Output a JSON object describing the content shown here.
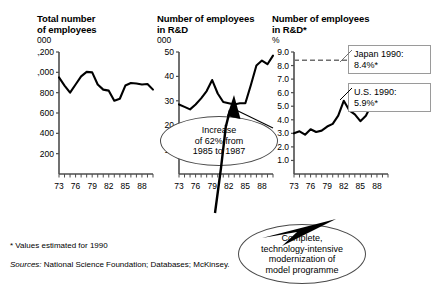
{
  "figure": {
    "footnote": "* Values estimated for 1990",
    "sources_label": "Sources:",
    "sources_text": "National Science Foundation; Databases; McKinsey."
  },
  "callouts": {
    "japan": "Japan 1990:\n8.4%*",
    "us": "U.S. 1990:\n5.9%*"
  },
  "notes": {
    "increase": "Increase\nof 62% from\n1985 to 1987",
    "modernization": "Complete,\ntechnology-intensive\nmodernization of\nmodel programme"
  },
  "panels": {
    "p1": {
      "title": "Total number\nof employees",
      "unit": "000"
    },
    "p2": {
      "title": "Number of employees\nin R&D",
      "unit": "000"
    },
    "p3": {
      "title": "Number of employees\nin R&D*",
      "unit": "%"
    }
  },
  "chart_data": [
    {
      "id": "total-employees",
      "type": "line",
      "title": "Total number of employees",
      "xlabel": "",
      "ylabel": "000",
      "ylim": [
        0,
        1200
      ],
      "yticks": [
        200,
        400,
        600,
        800,
        1000,
        1200
      ],
      "ytick_labels": [
        "200",
        "400",
        "600",
        "800",
        "1,000",
        "1,200"
      ],
      "xlim": [
        73,
        90
      ],
      "xticks": [
        73,
        76,
        79,
        82,
        85,
        88
      ],
      "xtick_labels": [
        "73",
        "76",
        "79",
        "82",
        "85",
        "88"
      ],
      "grid": false,
      "x": [
        73,
        74,
        75,
        76,
        77,
        78,
        79,
        80,
        81,
        82,
        83,
        84,
        85,
        86,
        87,
        88,
        89,
        90
      ],
      "values": [
        950,
        870,
        800,
        880,
        960,
        1005,
        1000,
        880,
        830,
        820,
        720,
        740,
        870,
        895,
        890,
        880,
        885,
        830
      ]
    },
    {
      "id": "rd-employees",
      "type": "line",
      "title": "Number of employees in R&D",
      "xlabel": "",
      "ylabel": "000",
      "ylim": [
        0,
        50
      ],
      "yticks": [
        10,
        20,
        30,
        40,
        50
      ],
      "ytick_labels": [
        "10",
        "20",
        "30",
        "40",
        "50"
      ],
      "xlim": [
        73,
        90
      ],
      "xticks": [
        73,
        76,
        79,
        82,
        85,
        88
      ],
      "xtick_labels": [
        "73",
        "76",
        "79",
        "82",
        "85",
        "88"
      ],
      "grid": false,
      "x": [
        73,
        74,
        75,
        76,
        77,
        78,
        79,
        80,
        81,
        82,
        83,
        84,
        85,
        86,
        87,
        88,
        89,
        90
      ],
      "values": [
        28.5,
        27.5,
        26.5,
        28.5,
        31.0,
        34.0,
        38.5,
        33.0,
        29.5,
        29.0,
        28.5,
        29.0,
        29.0,
        36.5,
        44.5,
        46.5,
        45.0,
        48.5
      ]
    },
    {
      "id": "rd-share",
      "type": "line",
      "title": "Number of employees in R&D*",
      "xlabel": "",
      "ylabel": "%",
      "ylim": [
        0,
        9
      ],
      "yticks": [
        1,
        2,
        3,
        4,
        5,
        6,
        7,
        8,
        9
      ],
      "ytick_labels": [
        "1.0",
        "2.0",
        "3.0",
        "4.0",
        "5.0",
        "6.0",
        "7.0",
        "8.0",
        "9.0"
      ],
      "xlim": [
        73,
        90
      ],
      "xticks": [
        73,
        76,
        79,
        82,
        85,
        88
      ],
      "xtick_labels": [
        "73",
        "76",
        "79",
        "82",
        "85",
        "88"
      ],
      "grid": false,
      "reference_line": {
        "value": 8.4,
        "label": "Japan 1990: 8.4%*",
        "style": "dashed"
      },
      "x": [
        73,
        74,
        75,
        76,
        77,
        78,
        79,
        80,
        81,
        82,
        83,
        84,
        85,
        86,
        87,
        88,
        89,
        90
      ],
      "values": [
        3.0,
        3.15,
        2.9,
        3.3,
        3.1,
        3.2,
        3.5,
        3.7,
        4.3,
        5.4,
        4.7,
        4.4,
        3.9,
        4.3,
        5.1,
        5.4,
        5.3,
        5.9
      ]
    }
  ]
}
